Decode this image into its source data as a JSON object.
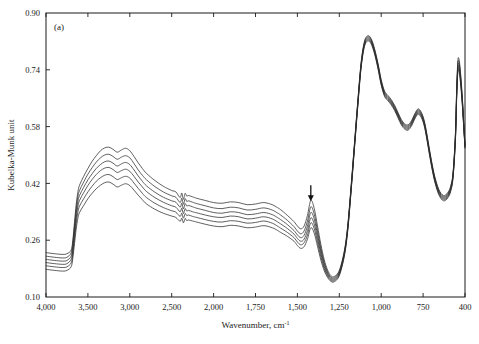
{
  "figure": {
    "panel_label": "(a)",
    "xlabel_main": "Wavenumber, cm",
    "xlabel_sup": "-1",
    "ylabel": "Kubelka-Munk unit"
  },
  "chart_data": {
    "type": "line",
    "title": "",
    "subtitle": "",
    "panel": "(a)",
    "xlabel": "Wavenumber, cm-1",
    "ylabel": "Kubelka-Munk unit",
    "grid": false,
    "legend": "none",
    "x_axis": {
      "direction": "reversed",
      "scale": "split-linear",
      "tick_labels": [
        "4,000",
        "3,500",
        "3,000",
        "2,500",
        "2,000",
        "1,750",
        "1,500",
        "1,250",
        "1,000",
        "750",
        "400"
      ],
      "tick_values": [
        4000,
        3500,
        3000,
        2500,
        2000,
        1750,
        1500,
        1250,
        1000,
        750,
        400
      ],
      "xlim": [
        4000,
        400
      ],
      "breakpoint": 2000,
      "note": "equal pixel spacing per tick: 500 cm-1 steps above 2000, 250 cm-1 steps below"
    },
    "y_axis": {
      "tick_labels": [
        "0.90",
        "0.74",
        "0.58",
        "0.42",
        "0.26",
        "0.10"
      ],
      "tick_values": [
        0.9,
        0.74,
        0.58,
        0.42,
        0.26,
        0.1
      ],
      "ylim": [
        0.1,
        0.9
      ]
    },
    "annotations": [
      {
        "type": "down-arrow",
        "x": 1420,
        "y": 0.37,
        "label": "arrow marking 1420 cm-1 band"
      }
    ],
    "series_count": 6,
    "series_description": "Six diffuse-reflectance FTIR spectra forming a fanned family; curves separate most strongly between 3700 and 1300 cm-1 and converge below 1300 cm-1.",
    "x": [
      4000,
      3900,
      3800,
      3750,
      3700,
      3680,
      3660,
      3640,
      3620,
      3600,
      3550,
      3500,
      3450,
      3400,
      3350,
      3300,
      3250,
      3200,
      3150,
      3100,
      3050,
      3000,
      2950,
      2900,
      2850,
      2800,
      2700,
      2600,
      2500,
      2450,
      2400,
      2380,
      2360,
      2340,
      2320,
      2300,
      2250,
      2200,
      2100,
      2000,
      1950,
      1900,
      1850,
      1800,
      1750,
      1700,
      1650,
      1620,
      1600,
      1560,
      1520,
      1500,
      1480,
      1460,
      1440,
      1420,
      1400,
      1380,
      1360,
      1340,
      1320,
      1300,
      1280,
      1250,
      1220,
      1200,
      1180,
      1160,
      1140,
      1120,
      1100,
      1080,
      1060,
      1040,
      1020,
      1000,
      980,
      960,
      940,
      920,
      900,
      880,
      860,
      840,
      820,
      800,
      780,
      760,
      740,
      720,
      700,
      680,
      660,
      640,
      620,
      600,
      580,
      560,
      540,
      520,
      500,
      480,
      470,
      460,
      450,
      440,
      430,
      420,
      410,
      400
    ],
    "series": [
      {
        "name": "spectrum-1-top",
        "values": [
          0.225,
          0.222,
          0.22,
          0.222,
          0.232,
          0.26,
          0.31,
          0.36,
          0.395,
          0.415,
          0.44,
          0.462,
          0.482,
          0.498,
          0.512,
          0.52,
          0.522,
          0.516,
          0.508,
          0.514,
          0.519,
          0.512,
          0.496,
          0.478,
          0.462,
          0.448,
          0.428,
          0.412,
          0.4,
          0.396,
          0.38,
          0.393,
          0.375,
          0.392,
          0.384,
          0.386,
          0.382,
          0.378,
          0.372,
          0.366,
          0.364,
          0.368,
          0.366,
          0.36,
          0.362,
          0.366,
          0.36,
          0.352,
          0.346,
          0.33,
          0.312,
          0.3,
          0.292,
          0.3,
          0.33,
          0.372,
          0.35,
          0.3,
          0.248,
          0.205,
          0.176,
          0.16,
          0.158,
          0.175,
          0.23,
          0.3,
          0.41,
          0.53,
          0.65,
          0.76,
          0.82,
          0.836,
          0.828,
          0.8,
          0.76,
          0.712,
          0.68,
          0.668,
          0.656,
          0.64,
          0.62,
          0.6,
          0.588,
          0.585,
          0.596,
          0.616,
          0.63,
          0.62,
          0.596,
          0.562,
          0.522,
          0.484,
          0.45,
          0.424,
          0.404,
          0.392,
          0.386,
          0.388,
          0.396,
          0.412,
          0.45,
          0.56,
          0.68,
          0.765,
          0.77,
          0.742,
          0.7,
          0.65,
          0.59,
          0.53
        ]
      },
      {
        "name": "spectrum-2",
        "values": [
          0.215,
          0.212,
          0.21,
          0.212,
          0.224,
          0.252,
          0.3,
          0.348,
          0.382,
          0.4,
          0.424,
          0.446,
          0.464,
          0.48,
          0.492,
          0.5,
          0.502,
          0.496,
          0.488,
          0.494,
          0.498,
          0.492,
          0.476,
          0.458,
          0.443,
          0.43,
          0.411,
          0.396,
          0.385,
          0.381,
          0.366,
          0.378,
          0.361,
          0.377,
          0.369,
          0.371,
          0.367,
          0.363,
          0.357,
          0.351,
          0.349,
          0.353,
          0.351,
          0.345,
          0.347,
          0.351,
          0.345,
          0.337,
          0.331,
          0.316,
          0.298,
          0.286,
          0.278,
          0.286,
          0.314,
          0.354,
          0.334,
          0.287,
          0.238,
          0.198,
          0.171,
          0.156,
          0.155,
          0.172,
          0.227,
          0.297,
          0.407,
          0.527,
          0.647,
          0.757,
          0.817,
          0.833,
          0.825,
          0.797,
          0.757,
          0.709,
          0.677,
          0.665,
          0.653,
          0.637,
          0.617,
          0.597,
          0.585,
          0.582,
          0.593,
          0.613,
          0.627,
          0.617,
          0.593,
          0.559,
          0.519,
          0.481,
          0.447,
          0.421,
          0.401,
          0.389,
          0.383,
          0.385,
          0.393,
          0.409,
          0.447,
          0.556,
          0.675,
          0.757,
          0.762,
          0.735,
          0.694,
          0.645,
          0.586,
          0.527
        ]
      },
      {
        "name": "spectrum-3",
        "values": [
          0.206,
          0.203,
          0.201,
          0.203,
          0.215,
          0.242,
          0.289,
          0.335,
          0.368,
          0.386,
          0.409,
          0.43,
          0.447,
          0.462,
          0.473,
          0.481,
          0.483,
          0.477,
          0.469,
          0.475,
          0.479,
          0.473,
          0.458,
          0.441,
          0.426,
          0.413,
          0.395,
          0.381,
          0.371,
          0.367,
          0.353,
          0.364,
          0.348,
          0.363,
          0.356,
          0.358,
          0.354,
          0.35,
          0.344,
          0.338,
          0.336,
          0.34,
          0.338,
          0.332,
          0.334,
          0.338,
          0.332,
          0.324,
          0.318,
          0.304,
          0.287,
          0.275,
          0.267,
          0.274,
          0.3,
          0.338,
          0.32,
          0.276,
          0.23,
          0.192,
          0.167,
          0.153,
          0.152,
          0.169,
          0.224,
          0.294,
          0.404,
          0.524,
          0.644,
          0.754,
          0.814,
          0.83,
          0.822,
          0.794,
          0.754,
          0.706,
          0.674,
          0.662,
          0.65,
          0.634,
          0.614,
          0.594,
          0.582,
          0.579,
          0.59,
          0.61,
          0.624,
          0.614,
          0.59,
          0.556,
          0.516,
          0.478,
          0.444,
          0.418,
          0.398,
          0.386,
          0.38,
          0.382,
          0.39,
          0.406,
          0.444,
          0.552,
          0.67,
          0.75,
          0.755,
          0.729,
          0.689,
          0.641,
          0.583,
          0.525
        ]
      },
      {
        "name": "spectrum-4",
        "values": [
          0.197,
          0.194,
          0.192,
          0.194,
          0.206,
          0.232,
          0.277,
          0.322,
          0.354,
          0.372,
          0.394,
          0.414,
          0.431,
          0.445,
          0.456,
          0.463,
          0.465,
          0.459,
          0.451,
          0.456,
          0.46,
          0.454,
          0.44,
          0.424,
          0.41,
          0.397,
          0.38,
          0.367,
          0.357,
          0.353,
          0.34,
          0.35,
          0.335,
          0.349,
          0.342,
          0.344,
          0.34,
          0.337,
          0.331,
          0.326,
          0.324,
          0.328,
          0.326,
          0.32,
          0.322,
          0.326,
          0.32,
          0.312,
          0.306,
          0.293,
          0.277,
          0.265,
          0.257,
          0.263,
          0.287,
          0.323,
          0.306,
          0.265,
          0.222,
          0.186,
          0.163,
          0.15,
          0.149,
          0.166,
          0.221,
          0.291,
          0.401,
          0.521,
          0.641,
          0.751,
          0.811,
          0.827,
          0.819,
          0.791,
          0.751,
          0.703,
          0.671,
          0.659,
          0.647,
          0.631,
          0.611,
          0.591,
          0.579,
          0.576,
          0.587,
          0.607,
          0.621,
          0.611,
          0.587,
          0.553,
          0.513,
          0.475,
          0.441,
          0.415,
          0.395,
          0.383,
          0.377,
          0.379,
          0.387,
          0.403,
          0.441,
          0.548,
          0.665,
          0.744,
          0.748,
          0.723,
          0.684,
          0.637,
          0.58,
          0.523
        ]
      },
      {
        "name": "spectrum-5",
        "values": [
          0.188,
          0.185,
          0.183,
          0.185,
          0.196,
          0.221,
          0.264,
          0.307,
          0.338,
          0.356,
          0.377,
          0.396,
          0.412,
          0.426,
          0.436,
          0.443,
          0.445,
          0.439,
          0.431,
          0.436,
          0.44,
          0.435,
          0.421,
          0.406,
          0.392,
          0.38,
          0.364,
          0.352,
          0.343,
          0.339,
          0.327,
          0.336,
          0.322,
          0.335,
          0.329,
          0.331,
          0.327,
          0.324,
          0.318,
          0.313,
          0.311,
          0.315,
          0.313,
          0.308,
          0.31,
          0.314,
          0.308,
          0.3,
          0.294,
          0.282,
          0.267,
          0.255,
          0.247,
          0.253,
          0.275,
          0.309,
          0.293,
          0.254,
          0.213,
          0.18,
          0.159,
          0.147,
          0.146,
          0.163,
          0.218,
          0.288,
          0.398,
          0.518,
          0.638,
          0.748,
          0.808,
          0.824,
          0.816,
          0.788,
          0.748,
          0.7,
          0.668,
          0.656,
          0.644,
          0.628,
          0.608,
          0.588,
          0.576,
          0.573,
          0.584,
          0.604,
          0.618,
          0.608,
          0.584,
          0.55,
          0.51,
          0.472,
          0.438,
          0.412,
          0.392,
          0.38,
          0.374,
          0.376,
          0.384,
          0.4,
          0.438,
          0.544,
          0.66,
          0.738,
          0.742,
          0.717,
          0.679,
          0.633,
          0.577,
          0.521
        ]
      },
      {
        "name": "spectrum-6-bottom",
        "values": [
          0.178,
          0.175,
          0.173,
          0.175,
          0.185,
          0.209,
          0.25,
          0.291,
          0.321,
          0.338,
          0.358,
          0.377,
          0.392,
          0.405,
          0.415,
          0.422,
          0.424,
          0.418,
          0.41,
          0.415,
          0.419,
          0.414,
          0.401,
          0.387,
          0.374,
          0.362,
          0.347,
          0.336,
          0.328,
          0.324,
          0.313,
          0.322,
          0.309,
          0.321,
          0.315,
          0.317,
          0.314,
          0.311,
          0.305,
          0.3,
          0.298,
          0.302,
          0.3,
          0.295,
          0.297,
          0.301,
          0.295,
          0.288,
          0.282,
          0.271,
          0.257,
          0.245,
          0.237,
          0.242,
          0.263,
          0.295,
          0.28,
          0.243,
          0.204,
          0.174,
          0.155,
          0.144,
          0.143,
          0.16,
          0.215,
          0.285,
          0.395,
          0.515,
          0.635,
          0.745,
          0.805,
          0.821,
          0.813,
          0.785,
          0.745,
          0.697,
          0.665,
          0.653,
          0.641,
          0.625,
          0.605,
          0.585,
          0.573,
          0.57,
          0.581,
          0.601,
          0.615,
          0.605,
          0.581,
          0.547,
          0.507,
          0.469,
          0.435,
          0.409,
          0.389,
          0.377,
          0.371,
          0.373,
          0.381,
          0.397,
          0.435,
          0.54,
          0.655,
          0.732,
          0.736,
          0.711,
          0.674,
          0.629,
          0.574,
          0.519
        ]
      }
    ]
  }
}
